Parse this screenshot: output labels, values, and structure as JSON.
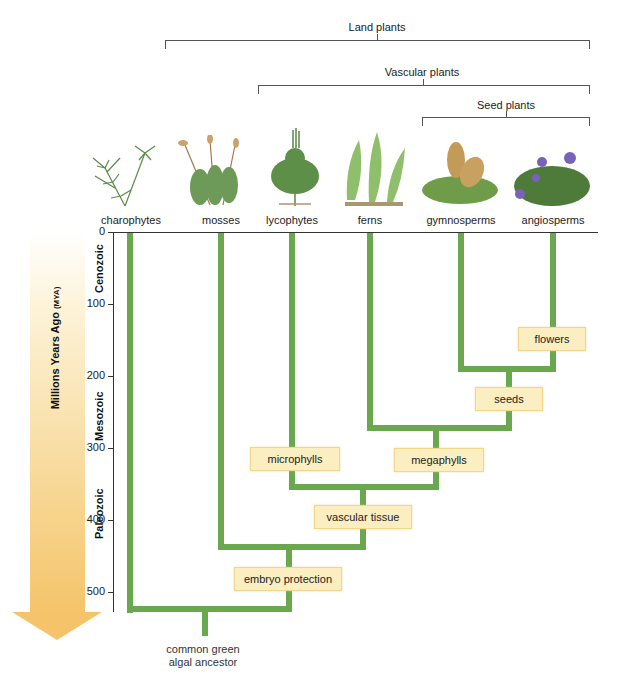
{
  "clades": [
    {
      "label": "Land plants"
    },
    {
      "label": "Vascular plants"
    },
    {
      "label": "Seed plants"
    }
  ],
  "taxa": [
    {
      "label": "charophytes"
    },
    {
      "label": "mosses"
    },
    {
      "label": "lycophytes"
    },
    {
      "label": "ferns"
    },
    {
      "label": "gymnosperms"
    },
    {
      "label": "angiosperms"
    }
  ],
  "axis": {
    "label": "Millions Years Ago",
    "unit": "(MYA)",
    "ticks": [
      "0",
      "100",
      "200",
      "300",
      "400",
      "500"
    ],
    "eras": [
      "Cenozoic",
      "Mesozoic",
      "Paleozoic"
    ]
  },
  "traits": [
    {
      "label": "flowers"
    },
    {
      "label": "seeds"
    },
    {
      "label": "microphylls"
    },
    {
      "label": "megaphylls"
    },
    {
      "label": "vascular tissue"
    },
    {
      "label": "embryo protection"
    }
  ],
  "root": {
    "line1": "common green",
    "line2": "algal ancestor"
  },
  "colors": {
    "branch": "#6aa84f",
    "trait_box": "#fbeec0",
    "arrow": "#f5c46a"
  }
}
